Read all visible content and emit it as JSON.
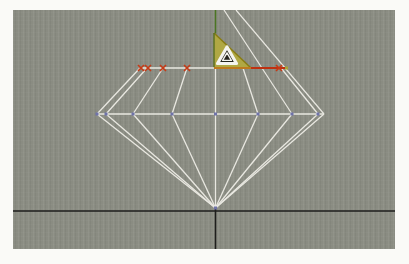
{
  "frame": {
    "background": "#fafaf7"
  },
  "viewport": {
    "x": 13,
    "y": 10,
    "width": 382,
    "height": 239,
    "background": "#8a8c82",
    "colors": {
      "wire": "#e9e8e1",
      "axis_black": "#1e1e1c",
      "axis_green": "#4b7523",
      "marker_red": "#c63a16",
      "segment_selected": "#bf3110",
      "segment_hot": "#bd7a1e",
      "vertex_blue": "#6f73a9",
      "triangle_fill": "#b3aa3e",
      "triangle_edge": "#897c12",
      "triangle_left_edge": "#5d7020",
      "badge_fill": "#24241c",
      "badge_stroke": "#f4f4ef",
      "endpoint_dot": "#aaa336"
    },
    "axes": {
      "horizontal": [
        13,
        211,
        395,
        211
      ],
      "vertical_lower": [
        215.5,
        205,
        215.5,
        249
      ],
      "green_upper": [
        215.5,
        10,
        215.5,
        33.5
      ]
    },
    "diamond": {
      "table_y": 68,
      "girdle_y": 114,
      "culet": [
        215.5,
        208
      ],
      "girdle_line": [
        96,
        114,
        324,
        114
      ],
      "center_line": [
        215.5,
        68,
        215.5,
        208
      ],
      "construction_lines": [
        [
          224,
          10,
          292,
          114
        ],
        [
          236,
          10,
          324,
          114
        ]
      ],
      "crown_facets": [
        [
          140,
          68,
          97,
          114
        ],
        [
          147,
          68,
          106,
          114
        ],
        [
          163,
          68,
          133,
          114
        ],
        [
          187,
          68,
          172,
          114
        ],
        [
          243,
          68,
          258,
          114
        ],
        [
          281,
          68,
          318,
          114
        ]
      ],
      "pavilion_girdle_xs": [
        97,
        106,
        133,
        172,
        258,
        292,
        318,
        324
      ],
      "table_segments": [
        {
          "x1": 140,
          "x2": 214,
          "color_key": "wire",
          "state": "normal"
        },
        {
          "x1": 214,
          "x2": 251,
          "color_key": "segment_hot",
          "state": "highlight"
        },
        {
          "x1": 251,
          "x2": 285.5,
          "color_key": "segment_selected",
          "state": "selected"
        }
      ],
      "table_marker_xs": [
        141,
        148,
        163,
        187,
        279
      ],
      "girdle_vertex_xs": [
        97,
        106,
        133,
        172,
        215.5,
        258,
        292,
        318
      ],
      "endpoint_dot": [
        286.5,
        68
      ]
    },
    "angle_triangle": {
      "points": [
        [
          214,
          33
        ],
        [
          214,
          68
        ],
        [
          251,
          68
        ]
      ]
    },
    "badge": {
      "cx": 227,
      "cy": 56,
      "icon": "delta-triangle-icon"
    }
  }
}
